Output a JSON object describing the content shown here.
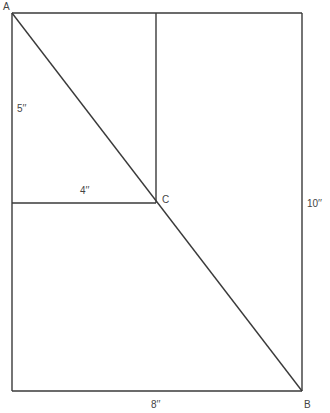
{
  "diagram": {
    "type": "geometry-figure",
    "stroke_color": "#3a3a3a",
    "label_color": "#444444",
    "points": {
      "A": {
        "label": "A",
        "x": 12,
        "y": 13,
        "label_x": 3,
        "label_y": 10
      },
      "B": {
        "label": "B",
        "x": 302,
        "y": 391,
        "label_x": 304,
        "label_y": 408
      },
      "C": {
        "label": "C",
        "x": 156,
        "y": 203,
        "label_x": 162,
        "label_y": 203
      }
    },
    "outer_rectangle": {
      "x1": 12,
      "y1": 13,
      "x2": 302,
      "y2": 391
    },
    "inner_rectangle": {
      "x1": 12,
      "y1": 13,
      "x2": 156,
      "y2": 203
    },
    "diagonal": {
      "from": "A",
      "to": "B"
    },
    "measurements": {
      "inner_height": {
        "text": "5′′",
        "x": 17,
        "y": 112
      },
      "inner_width": {
        "text": "4′′",
        "x": 80,
        "y": 194
      },
      "outer_height": {
        "text": "10′′",
        "x": 307,
        "y": 207
      },
      "outer_width": {
        "text": "8′′",
        "x": 151,
        "y": 408
      }
    }
  }
}
